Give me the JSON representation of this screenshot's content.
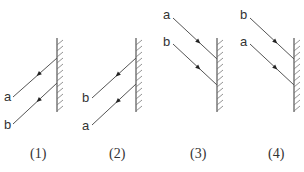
{
  "figure": {
    "panels": [
      {
        "caption": "(1)",
        "mirror": {
          "x": 57,
          "y1": 38,
          "y2": 112
        },
        "rays": [
          {
            "label": "a",
            "x1": 13,
            "y1": 97,
            "x2": 57,
            "y2": 58,
            "arrow_direction": "away-from-mirror",
            "label_x": 4,
            "label_y": 101
          },
          {
            "label": "b",
            "x1": 13,
            "y1": 124,
            "x2": 57,
            "y2": 83,
            "arrow_direction": "away-from-mirror",
            "label_x": 4,
            "label_y": 129
          }
        ]
      },
      {
        "caption": "(2)",
        "mirror": {
          "x": 136,
          "y1": 38,
          "y2": 112
        },
        "rays": [
          {
            "label": "b",
            "x1": 92,
            "y1": 98,
            "x2": 136,
            "y2": 58,
            "arrow_direction": "away-from-mirror",
            "label_x": 82,
            "label_y": 102
          },
          {
            "label": "a",
            "x1": 92,
            "y1": 125,
            "x2": 136,
            "y2": 84,
            "arrow_direction": "away-from-mirror",
            "label_x": 82,
            "label_y": 130
          }
        ]
      },
      {
        "caption": "(3)",
        "mirror": {
          "x": 217,
          "y1": 38,
          "y2": 112
        },
        "rays": [
          {
            "label": "a",
            "x1": 173,
            "y1": 18,
            "x2": 217,
            "y2": 59,
            "arrow_direction": "toward-mirror",
            "label_x": 163,
            "label_y": 19
          },
          {
            "label": "b",
            "x1": 173,
            "y1": 44,
            "x2": 217,
            "y2": 85,
            "arrow_direction": "toward-mirror",
            "label_x": 163,
            "label_y": 46
          }
        ]
      },
      {
        "caption": "(4)",
        "mirror": {
          "x": 294,
          "y1": 38,
          "y2": 112
        },
        "rays": [
          {
            "label": "b",
            "x1": 250,
            "y1": 18,
            "x2": 294,
            "y2": 59,
            "arrow_direction": "toward-mirror",
            "label_x": 240,
            "label_y": 19
          },
          {
            "label": "a",
            "x1": 250,
            "y1": 44,
            "x2": 294,
            "y2": 85,
            "arrow_direction": "toward-mirror",
            "label_x": 240,
            "label_y": 46
          }
        ]
      }
    ],
    "caption_y": 158,
    "caption_x": [
      30,
      109,
      190,
      268
    ],
    "colors": {
      "line": "#555555",
      "text": "#333333",
      "arrow": "#222222"
    }
  }
}
